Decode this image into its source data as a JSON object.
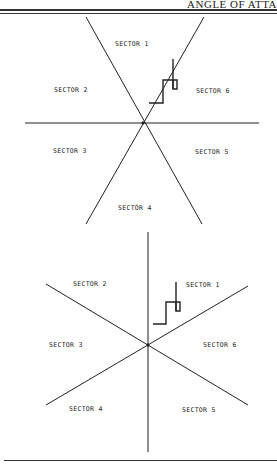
{
  "header": {
    "running_title": "ANGLE OF ATTA"
  },
  "figures": [
    {
      "id": "top-diagram",
      "center": [
        143,
        123
      ],
      "sectors": [
        {
          "label": "SECTOR  1",
          "x": 115,
          "y": 46
        },
        {
          "label": "SECTOR 2",
          "x": 54,
          "y": 92
        },
        {
          "label": "SECTOR 6",
          "x": 196,
          "y": 93
        },
        {
          "label": "SECTOR 3",
          "x": 53,
          "y": 153
        },
        {
          "label": "SECTOR 5",
          "x": 195,
          "y": 154
        },
        {
          "label": "SECTÓR  4",
          "x": 118,
          "y": 210
        }
      ]
    },
    {
      "id": "bottom-diagram",
      "center": [
        148,
        345
      ],
      "sectors": [
        {
          "label": "SECTOR 2",
          "x": 73,
          "y": 286
        },
        {
          "label": "SECTOR 1",
          "x": 186,
          "y": 287
        },
        {
          "label": "SECTOR 3",
          "x": 49,
          "y": 347
        },
        {
          "label": "SECTOR 6",
          "x": 203,
          "y": 347
        },
        {
          "label": "SECTOR 4",
          "x": 69,
          "y": 411
        },
        {
          "label": "SECTOR 5",
          "x": 182,
          "y": 412
        }
      ]
    }
  ]
}
